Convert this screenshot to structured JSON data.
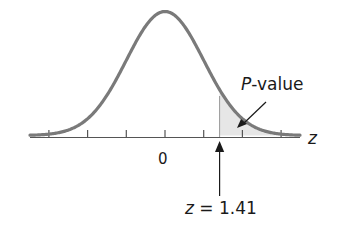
{
  "figure": {
    "curve_color": "#7a7a7a",
    "shade_color": "#e6e6e6",
    "axis_color": "#555555",
    "ticks": [
      -3,
      -2,
      -1,
      0,
      1,
      2,
      3
    ],
    "tick_label_zero": "0",
    "axis_label": "z",
    "pvalue_label_italic": "P",
    "pvalue_label_rest": "-value",
    "z_marker_italic": "z",
    "z_marker_rest": " = 1.41",
    "z_value": 1.41
  }
}
